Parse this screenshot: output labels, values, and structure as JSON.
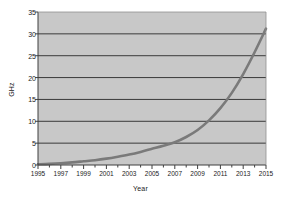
{
  "chart_data": {
    "type": "line",
    "title": "",
    "xlabel": "Year",
    "ylabel": "GHz",
    "xlim": [
      1995,
      2015
    ],
    "ylim": [
      0,
      35
    ],
    "grid": true,
    "legend": null,
    "x_tick_labels": [
      "1995",
      "1997",
      "1999",
      "2001",
      "2003",
      "2005",
      "2007",
      "2009",
      "2011",
      "2013",
      "2015"
    ],
    "x_tick_values": [
      1995,
      1997,
      1999,
      2001,
      2003,
      2005,
      2007,
      2009,
      2011,
      2013,
      2015
    ],
    "y_tick_labels": [
      "0",
      "5",
      "10",
      "15",
      "20",
      "25",
      "30",
      "35"
    ],
    "y_tick_values": [
      0,
      5,
      10,
      15,
      20,
      25,
      30,
      35
    ],
    "x": [
      1995,
      1996,
      1997,
      1998,
      1999,
      2000,
      2001,
      2002,
      2003,
      2004,
      2005,
      2006,
      2007,
      2008,
      2009,
      2010,
      2011,
      2012,
      2013,
      2014,
      2015
    ],
    "values": [
      0.15,
      0.25,
      0.4,
      0.6,
      0.85,
      1.1,
      1.45,
      1.9,
      2.4,
      3.0,
      3.7,
      4.4,
      5.2,
      6.4,
      8.0,
      10.2,
      13.0,
      16.5,
      20.8,
      25.8,
      31.2
    ],
    "series": [
      {
        "name": "CPU clock speed",
        "color": "#7a7a7a",
        "values": [
          0.15,
          0.25,
          0.4,
          0.6,
          0.85,
          1.1,
          1.45,
          1.9,
          2.4,
          3.0,
          3.7,
          4.4,
          5.2,
          6.4,
          8.0,
          10.2,
          13.0,
          16.5,
          20.8,
          25.8,
          31.2
        ]
      }
    ]
  },
  "style": {
    "plot_background": "#c8c8c8",
    "gridline_color": "#3a3a3a",
    "axis_color": "#3f3f3f",
    "line_color": "#7a7a7a",
    "text_color": "#1a1a1a"
  },
  "geometry": {
    "plot_left": 38,
    "plot_right": 266,
    "plot_top": 12,
    "plot_bottom": 165
  }
}
